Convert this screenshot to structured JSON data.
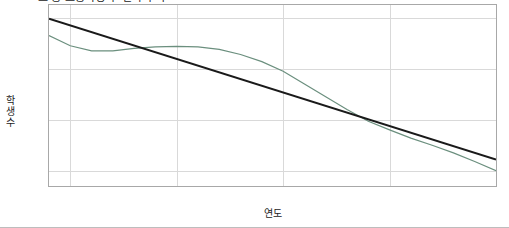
{
  "chart_data": {
    "type": "line",
    "title": "초·중·고등학생 수 변화 추이",
    "xlabel": "연도",
    "ylabel": "학생수",
    "xlim": [
      1999,
      2020
    ],
    "ylim": [
      5700000,
      9250000
    ],
    "grid": true,
    "legend": "none",
    "xticks": [
      "2000",
      "2005",
      "2010",
      "2015",
      "2020"
    ],
    "xtick_values": [
      2000,
      2005,
      2010,
      2015,
      2020
    ],
    "yticks": [
      "6e+06",
      "7e+06",
      "8e+06",
      "9e+06"
    ],
    "ytick_values": [
      6000000,
      7000000,
      8000000,
      9000000
    ],
    "series": [
      {
        "name": "학생수",
        "color": "#6b8f7e",
        "x": [
          1999,
          2000,
          2001,
          2002,
          2003,
          2004,
          2005,
          2006,
          2007,
          2008,
          2009,
          2010,
          2011,
          2012,
          2013,
          2014,
          2015,
          2016,
          2017,
          2018,
          2019,
          2020
        ],
        "values": [
          8650000,
          8450000,
          8350000,
          8350000,
          8400000,
          8430000,
          8440000,
          8430000,
          8380000,
          8280000,
          8140000,
          7950000,
          7700000,
          7450000,
          7200000,
          6970000,
          6800000,
          6640000,
          6500000,
          6350000,
          6180000,
          6000000
        ]
      },
      {
        "name": "추세선",
        "color": "#1a1a1a",
        "x": [
          1999,
          2020
        ],
        "values": [
          8980000,
          6220000
        ]
      }
    ]
  }
}
